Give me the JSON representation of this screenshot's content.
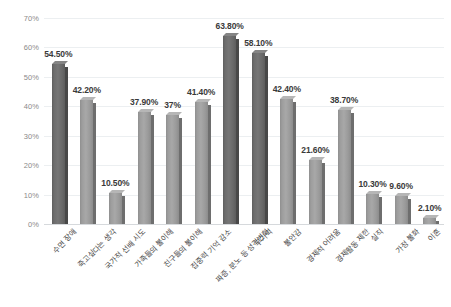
{
  "chart_data": {
    "type": "bar",
    "title": "",
    "subtitle": "",
    "xlabel": "",
    "ylabel": "",
    "ylim": [
      0,
      70
    ],
    "grid": true,
    "legend": "none",
    "y_ticks": [
      "0%",
      "10%",
      "20%",
      "30%",
      "40%",
      "50%",
      "60%",
      "70%"
    ],
    "y_tick_values": [
      0,
      10,
      20,
      30,
      40,
      50,
      60,
      70
    ],
    "categories": [
      "수면 장애",
      "죽고싶다는 생각",
      "국가적 선배 시도",
      "가족들의 불이해",
      "친구들의 불이해",
      "집중력 기억 감소",
      "짜증, 분노 등 성격변화",
      "무기력",
      "불안감",
      "경제적 어려움",
      "경제활동 제한",
      "실직",
      "가정 불화",
      "이혼"
    ],
    "values": [
      54.5,
      42.2,
      10.5,
      37.9,
      37,
      41.4,
      63.8,
      58.1,
      42.4,
      21.6,
      38.7,
      10.3,
      9.6,
      2.1
    ],
    "value_labels": [
      "54.50%",
      "42.20%",
      "10.50%",
      "37.90%",
      "37%",
      "41.40%",
      "63.80%",
      "58.10%",
      "42.40%",
      "21.60%",
      "38.70%",
      "10.30%",
      "9.60%",
      "2.10%"
    ],
    "bar_styles": [
      "dark",
      "light",
      "light",
      "light",
      "light",
      "light",
      "dark",
      "dark",
      "light",
      "light",
      "light",
      "light",
      "light",
      "light"
    ],
    "colors": {
      "bar_light": "#a8a8a8",
      "bar_dark": "#767676",
      "gridline": "#eceff1",
      "axis": "#d6d9dc",
      "value_text": "#3a3a3a",
      "tick_text": "#8a8a8a",
      "category_text": "#4a4a4a",
      "background": "#ffffff"
    }
  }
}
